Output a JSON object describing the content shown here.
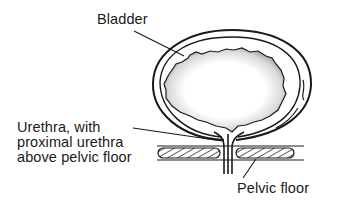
{
  "figure": {
    "labels": {
      "bladder": "Bladder",
      "urethra_lines": [
        "Urethra, with",
        "proximal urethra",
        "above pelvic floor"
      ],
      "pelvic_floor": "Pelvic floor"
    },
    "colors": {
      "ink": "#1a1a1a",
      "background": "#ffffff",
      "stipple": "#555555"
    }
  }
}
